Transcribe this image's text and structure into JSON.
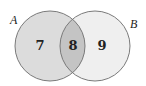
{
  "diagram": {
    "type": "venn",
    "sets": [
      {
        "name": "A",
        "only_count": "7",
        "fill": "#dcdcdc"
      },
      {
        "name": "B",
        "only_count": "9",
        "fill": "#efefef"
      }
    ],
    "intersection": {
      "count": "8",
      "fill": "#c4c4c4"
    },
    "stroke": "#7a7a7a"
  }
}
